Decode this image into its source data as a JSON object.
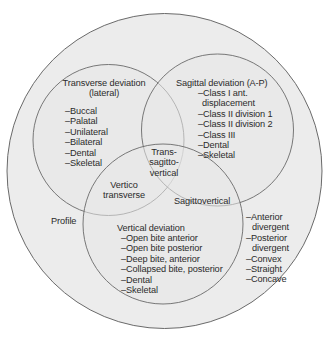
{
  "diagram": {
    "outer_label": "Profile",
    "colors": {
      "background": "#ffffff",
      "outer_fill": "#ececec",
      "inner_fill": "#e6e6e6",
      "stroke": "#6a6a6a",
      "text": "#2b2b2b"
    },
    "transverse": {
      "title_line1": "Transverse deviation",
      "title_line2": "(lateral)",
      "items": [
        "–Buccal",
        "–Palatal",
        "–Unilateral",
        "–Bilateral",
        "–Dental",
        "–Skeletal"
      ]
    },
    "sagittal": {
      "title": "Sagittal deviation (A-P)",
      "items": [
        "–Class I ant.",
        "displacement",
        "–Class II division 1",
        "–Class II division 2",
        "–Class III",
        "–Dental",
        "–Skeletal"
      ]
    },
    "vertical": {
      "title": "Vertical deviation",
      "items": [
        "–Open bite anterior",
        "–Open bite posterior",
        "–Deep bite, anterior",
        "–Collapsed bite, posterior",
        "–Dental",
        "–Skeletal"
      ]
    },
    "intersections": {
      "center_line1": "Trans-",
      "center_line2": "sagitto-",
      "center_line3": "vertical",
      "vertico_line1": "Vertico",
      "vertico_line2": "transverse",
      "sagittovertical": "Sagittovertical"
    },
    "profile": {
      "items": [
        "–Anterior",
        "divergent",
        "–Posterior",
        "divergent",
        "–Convex",
        "–Straight",
        "–Concave"
      ]
    }
  }
}
